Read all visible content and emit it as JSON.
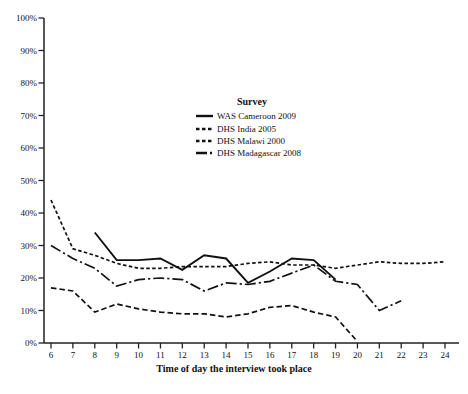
{
  "chart_data": {
    "type": "line",
    "title": "",
    "xlabel": "Time of day the interview took place",
    "ylabel": "",
    "xlim": [
      6,
      24
    ],
    "ylim": [
      0,
      100
    ],
    "grid": false,
    "legend_title": "Survey",
    "legend_position": "inside-top-center",
    "line_color": "#111111",
    "x_tick_labels": [
      "6",
      "7",
      "8",
      "9",
      "10",
      "11",
      "12",
      "13",
      "14",
      "15",
      "16",
      "17",
      "18",
      "19",
      "20",
      "21",
      "22",
      "23",
      "24"
    ],
    "y_tick_labels": [
      "0%",
      "10%",
      "20%",
      "30%",
      "40%",
      "50%",
      "60%",
      "70%",
      "80%",
      "90%",
      "100%"
    ],
    "series": [
      {
        "name": "WAS Cameroon 2009",
        "line_style": "solid",
        "color": "#111111",
        "x": [
          8,
          9,
          10,
          11,
          12,
          13,
          14,
          15,
          16,
          17,
          18,
          19
        ],
        "values": [
          34,
          25.5,
          25.5,
          26,
          22.5,
          27,
          26,
          18.5,
          22,
          26,
          25.5,
          19.5
        ]
      },
      {
        "name": "DHS India 2005",
        "line_style": "dashed-short",
        "color": "#111111",
        "x": [
          6,
          7,
          8,
          9,
          10,
          11,
          12,
          13,
          14,
          15,
          16,
          17,
          18,
          19,
          20,
          21,
          22,
          23,
          24
        ],
        "values": [
          44,
          29,
          27,
          24.5,
          23,
          23,
          23.5,
          23.5,
          23.5,
          24.5,
          25,
          24,
          24,
          23,
          24,
          25,
          24.5,
          24.5,
          25
        ]
      },
      {
        "name": "DHS Malawi 2000",
        "line_style": "dashed",
        "color": "#111111",
        "x": [
          6,
          7,
          8,
          9,
          10,
          11,
          12,
          13,
          14,
          15,
          16,
          17,
          18,
          19,
          20
        ],
        "values": [
          17,
          16,
          9.5,
          12,
          10.5,
          9.5,
          9,
          9,
          8,
          9,
          11,
          11.5,
          9.5,
          8,
          0.5
        ]
      },
      {
        "name": "DHS Madagascar 2008",
        "line_style": "dash-dot",
        "color": "#111111",
        "x": [
          6,
          7,
          8,
          9,
          10,
          11,
          12,
          13,
          14,
          15,
          16,
          17,
          18,
          19,
          20,
          21,
          22
        ],
        "values": [
          30,
          26,
          23,
          17.5,
          19.5,
          20,
          19.5,
          16,
          18.5,
          18,
          19,
          21.5,
          24,
          19,
          18,
          10,
          13
        ]
      }
    ]
  },
  "legend": {
    "title": "Survey",
    "items": [
      {
        "label": "WAS Cameroon 2009"
      },
      {
        "label": "DHS India 2005"
      },
      {
        "label": "DHS Malawi 2000"
      },
      {
        "label": "DHS Madagascar 2008"
      }
    ]
  },
  "axes": {
    "x_title": "Time of day the interview took place"
  },
  "colors": {
    "background": "#ffffff",
    "axis": "#222222",
    "line": "#111111",
    "text": "#111111"
  }
}
